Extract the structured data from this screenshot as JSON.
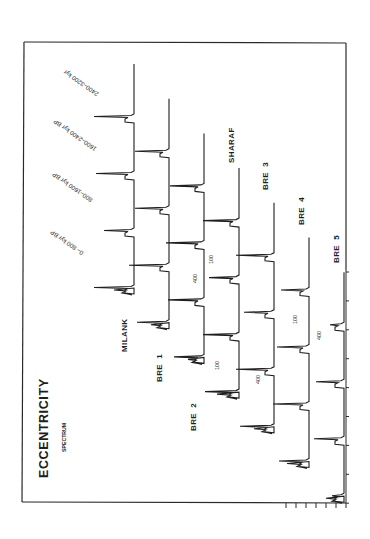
{
  "chart_data": {
    "type": "line",
    "title": "ECCENTRICITY",
    "subtitle": "SPECTRUM",
    "orientation": "rotated-90",
    "time_windows": [
      "0– 800 kyr BP",
      "800–1600 kyr BP",
      "1600–2400 kyr BP",
      "2400–3200 kyr"
    ],
    "peak_labels": [
      "400",
      "100"
    ],
    "series": [
      {
        "name": "MILANK",
        "segments": [
          {
            "peak400": 40,
            "peak100": 14
          },
          {
            "peak400": 38,
            "peak100": 14
          },
          {
            "peak400": 30,
            "peak100": 8
          },
          {
            "peak400": 40,
            "peak100": 20
          }
        ]
      },
      {
        "name": "BRE 1",
        "segments": [
          {
            "peak400": 34,
            "peak100": 20
          },
          {
            "peak400": 34,
            "peak100": 14
          },
          {
            "peak400": 40,
            "peak100": 16
          },
          {
            "peak400": 32,
            "peak100": 18
          }
        ]
      },
      {
        "name": "BRE 2",
        "segments": [
          {
            "peak400": 34,
            "peak100": 20
          },
          {
            "peak400": 38,
            "peak100": 22
          },
          {
            "peak400": 36,
            "peak100": 18
          },
          {
            "peak400": 30,
            "peak100": 16
          }
        ]
      },
      {
        "name": "SHARAF",
        "segments": [
          {
            "peak400": 36,
            "peak100": 18
          },
          {
            "peak400": 30,
            "peak100": 22
          },
          {
            "peak400": 36,
            "peak100": 20
          },
          {
            "peak400": 34,
            "peak100": 22
          }
        ]
      },
      {
        "name": "BRE 3",
        "segments": [
          {
            "peak400": 38,
            "peak100": 20
          },
          {
            "peak400": 30,
            "peak100": 22
          },
          {
            "peak400": 38,
            "peak100": 16
          },
          {
            "peak400": 34,
            "peak100": 20
          }
        ]
      },
      {
        "name": "BRE 4",
        "segments": [
          {
            "peak400": 28,
            "peak100": 24
          },
          {
            "peak400": 32,
            "peak100": 20
          },
          {
            "peak400": 36,
            "peak100": 18
          },
          {
            "peak400": 30,
            "peak100": 22
          }
        ]
      },
      {
        "name": "BRE 5",
        "segments": [
          {
            "peak400": 14,
            "peak100": 18
          },
          {
            "peak400": 28,
            "peak100": 10
          },
          {
            "peak400": 30,
            "peak100": 8
          },
          {
            "peak400": 12,
            "peak100": 18
          }
        ]
      }
    ],
    "xlabel": "",
    "ylabel": "",
    "axis_ticks_right": 9,
    "axis_ticks_bottom": 7,
    "grid": false,
    "legend": "inline labels"
  },
  "figure": {
    "title": "ECCENTRICITY",
    "subtitle": "SPECTRUM",
    "time_windows": [
      "0– 800 kyr BP",
      "800–1600 kyr BP",
      "1600–2400 kyr BP",
      "2400–3200 kyr"
    ],
    "series_labels": [
      "MILANK",
      "BRE  1",
      "BRE  2",
      "SHARAF",
      "BRE  3",
      "BRE  4",
      "BRE  5"
    ],
    "annotations": [
      {
        "text": "400",
        "x": 197,
        "y": 283
      },
      {
        "text": "100",
        "x": 213,
        "y": 264
      },
      {
        "text": "100",
        "x": 219,
        "y": 370
      },
      {
        "text": "400",
        "x": 260,
        "y": 384
      },
      {
        "text": "100",
        "x": 297,
        "y": 324
      },
      {
        "text": "400",
        "x": 321,
        "y": 340
      }
    ]
  }
}
